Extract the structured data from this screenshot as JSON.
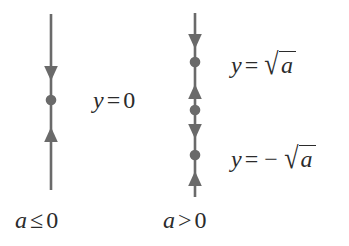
{
  "figure": {
    "type": "phase-line-diagram",
    "background_color": "#ffffff",
    "stroke_color": "#6a6a6a",
    "text_color": "#2b2b2b",
    "width": 349,
    "height": 246
  },
  "left_phase_line": {
    "caption": "a ≤ 0",
    "caption_parts": {
      "variable": "a",
      "relation": "≤",
      "value": "0"
    },
    "axis_x": 51,
    "axis_top": 14,
    "axis_bottom": 190,
    "equilibria": [
      {
        "name": "origin",
        "y": 100,
        "label": "y = 0",
        "stability": "semi-stable"
      }
    ],
    "arrows": [
      {
        "direction": "down",
        "y": 74
      },
      {
        "direction": "up",
        "y": 135
      }
    ]
  },
  "right_phase_line": {
    "caption": "a > 0",
    "caption_parts": {
      "variable": "a",
      "relation": ">",
      "value": "0"
    },
    "axis_x": 195,
    "axis_top": 13,
    "axis_bottom": 197,
    "equilibria": [
      {
        "name": "upper",
        "y": 62,
        "stability": "unstable"
      },
      {
        "name": "origin",
        "y": 110,
        "stability": "stable"
      },
      {
        "name": "lower",
        "y": 155,
        "stability": "unstable"
      }
    ],
    "arrows": [
      {
        "direction": "down",
        "y": 42
      },
      {
        "direction": "up",
        "y": 92
      },
      {
        "direction": "down",
        "y": 132
      },
      {
        "direction": "up",
        "y": 178
      }
    ]
  },
  "labels": {
    "y_equals_zero": {
      "lhs": "y",
      "eq": "=",
      "rhs": "0"
    },
    "y_equals_sqrt_a": {
      "lhs": "y",
      "eq": "=",
      "sign": "",
      "radical_glyph": "√",
      "radicand": "a"
    },
    "y_equals_neg_sqrt_a": {
      "lhs": "y",
      "eq": "=",
      "sign": "−",
      "radical_glyph": "√",
      "radicand": "a"
    }
  }
}
